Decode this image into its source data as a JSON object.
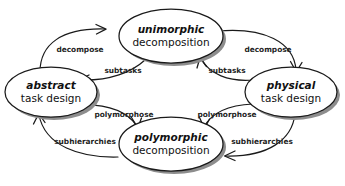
{
  "diagram": {
    "type": "cycle-diagram",
    "colors": {
      "background": "#ffffff",
      "stroke": "#1a1a1a",
      "shadow": "#8d8d8d",
      "text": "#111111"
    },
    "nodes": [
      {
        "id": "unimorphic-decomposition",
        "line1": "unimorphic",
        "line2": "decomposition",
        "position": "top"
      },
      {
        "id": "physical-task-design",
        "line1": "physical",
        "line2": "task design",
        "position": "right"
      },
      {
        "id": "polymorphic-decomposition",
        "line1": "polymorphic",
        "line2": "decomposition",
        "position": "bottom"
      },
      {
        "id": "abstract-task-design",
        "line1": "abstract",
        "line2": "task design",
        "position": "left"
      }
    ],
    "edges": [
      {
        "id": "abstract-to-unimorphic",
        "label": "decompose",
        "from": "abstract-task-design",
        "to": "unimorphic-decomposition"
      },
      {
        "id": "unimorphic-to-physical",
        "label": "decompose",
        "from": "unimorphic-decomposition",
        "to": "physical-task-design"
      },
      {
        "id": "unimorphic-to-abstract",
        "label": "subtasks",
        "from": "unimorphic-decomposition",
        "to": "abstract-task-design"
      },
      {
        "id": "physical-to-unimorphic",
        "label": "subtasks",
        "from": "physical-task-design",
        "to": "unimorphic-decomposition"
      },
      {
        "id": "abstract-to-polymorphic",
        "label": "polymorphose",
        "from": "abstract-task-design",
        "to": "polymorphic-decomposition"
      },
      {
        "id": "physical-to-polymorphic",
        "label": "polymorphose",
        "from": "physical-task-design",
        "to": "polymorphic-decomposition"
      },
      {
        "id": "polymorphic-to-abstract",
        "label": "subhierarchies",
        "from": "polymorphic-decomposition",
        "to": "abstract-task-design"
      },
      {
        "id": "polymorphic-to-physical",
        "label": "subhierarchies",
        "from": "polymorphic-decomposition",
        "to": "physical-task-design"
      }
    ]
  }
}
